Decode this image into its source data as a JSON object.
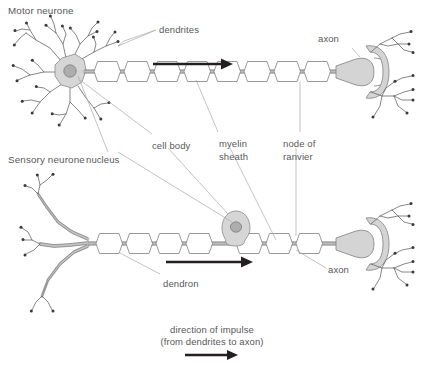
{
  "diagram": {
    "title_motor": "Motor neurone",
    "title_sensory": "Sensory neurone",
    "labels": {
      "dendrites": "dendrites",
      "axon_top": "axon",
      "nucleus": "nucleus",
      "cell_body": "cell body",
      "myelin_sheath_line1": "myelin",
      "myelin_sheath_line2": "sheath",
      "node_of_ranvier_line1": "node of",
      "node_of_ranvier_line2": "ranvier",
      "dendron": "dendron",
      "axon_bottom": "axon",
      "direction_line1": "direction of impulse",
      "direction_line2": "(from dendrites to axon)"
    },
    "colors": {
      "text": "#58585a",
      "leader": "#a9a9ab",
      "arrow": "#231f20",
      "soma_fill": "#d6d6d6",
      "nucleus_fill": "#adadad",
      "myelin_stroke": "#7f7f81",
      "axon_fill": "#bdbdbd",
      "background": "#ffffff"
    },
    "structure": {
      "motor_myelin_segment_count": 8,
      "sensory_myelin_segment_count": 7,
      "impulse_direction": "left-to-right"
    }
  }
}
